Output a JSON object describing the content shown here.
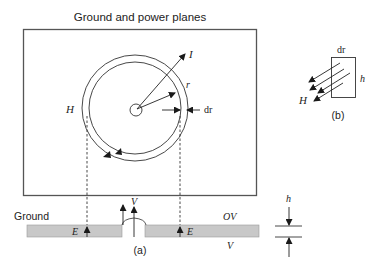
{
  "figure": {
    "title": "Ground and power planes",
    "panel_a": {
      "label": "(a)",
      "current_label": "I",
      "radius_label": "r",
      "ring_width_label": "dr",
      "field_label": "H",
      "ground_label": "Ground",
      "voltage_top_label": "OV",
      "voltage_bottom_label": "V",
      "via_voltage_label": "V",
      "efield_left_label": "E",
      "efield_right_label": "E",
      "separation_label": "h"
    },
    "panel_b": {
      "label": "(b)",
      "width_label": "dr",
      "height_label": "h",
      "field_label": "H"
    }
  },
  "colors": {
    "line": "#1a1a1a",
    "plane_fill": "#c8c8c8",
    "plane_edge": "#9a9a9a",
    "frame": "#555555"
  }
}
